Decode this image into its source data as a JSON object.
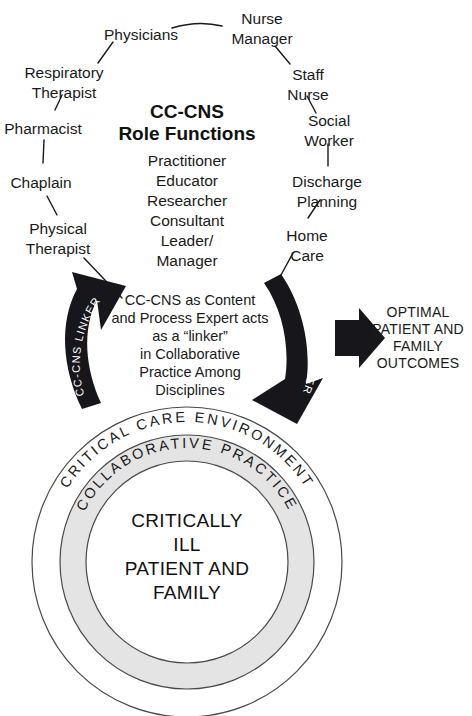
{
  "figure": {
    "title_line1": "CC-CNS",
    "title_line2": "Role Functions"
  },
  "role_functions": [
    "Practitioner",
    "Educator",
    "Researcher",
    "Consultant",
    "Leader/",
    "Manager"
  ],
  "disciplines_left": [
    "Physicians",
    "Respiratory",
    "Therapist",
    "Pharmacist",
    "Chaplain",
    "Physical",
    "Therapist"
  ],
  "disciplines_right": [
    "Nurse",
    "Manager",
    "Staff",
    "Nurse",
    "Social",
    "Worker",
    "Discharge",
    "Planning",
    "Home",
    "Care"
  ],
  "nodes": {
    "physicians": "Physicians",
    "nurse_manager_l1": "Nurse",
    "nurse_manager_l2": "Manager",
    "respiratory_l1": "Respiratory",
    "respiratory_l2": "Therapist",
    "staff_nurse_l1": "Staff",
    "staff_nurse_l2": "Nurse",
    "pharmacist": "Pharmacist",
    "social_worker_l1": "Social",
    "social_worker_l2": "Worker",
    "chaplain": "Chaplain",
    "discharge_l1": "Discharge",
    "discharge_l2": "Planning",
    "physical_l1": "Physical",
    "physical_l2": "Therapist",
    "home_care_l1": "Home",
    "home_care_l2": "Care"
  },
  "center_statement": {
    "line1": "CC-CNS as Content",
    "line2": "and Process Expert acts",
    "line3": "as a “linker”",
    "line4": "in Collaborative",
    "line5": "Practice Among",
    "line6": "Disciplines"
  },
  "linker_arrows": {
    "left_label": "CC-CNS LINKER",
    "right_label": "CC-CNS LINKER"
  },
  "outcomes": {
    "line1": "OPTIMAL",
    "line2": "PATIENT AND",
    "line3": "FAMILY",
    "line4": "OUTCOMES"
  },
  "rings": {
    "outer_label": "CRITICAL CARE ENVIRONMENT",
    "middle_label": "COLLABORATIVE PRACTICE"
  },
  "core": {
    "line1": "CRITICALLY",
    "line2": "ILL",
    "line3": "PATIENT AND",
    "line4": "FAMILY"
  },
  "colors": {
    "background": "#ffffff",
    "ink": "#1a1a1a",
    "arrow_fill": "#17161a",
    "ring_gray": "#e2e2e2",
    "ring_stroke": "#4a4a4a"
  }
}
